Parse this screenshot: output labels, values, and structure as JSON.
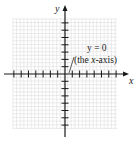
{
  "figure": {
    "type": "coordinate-plane",
    "axes": {
      "x_label": "x",
      "y_label": "y"
    },
    "annotation": {
      "equation": "y = 0",
      "description_prefix": "(the ",
      "description_var": "x",
      "description_suffix": "-axis)"
    },
    "grid": {
      "x_min": -7,
      "x_max": 7,
      "y_min": -7,
      "y_max": 7,
      "minor_per_unit": 2
    },
    "colors": {
      "axis": "#1a1a1a",
      "grid": "#d9d9d9",
      "text": "#222222"
    }
  }
}
